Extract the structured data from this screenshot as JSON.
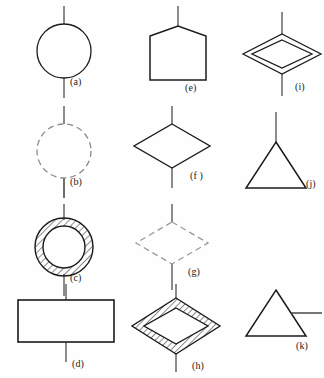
{
  "figure": {
    "background_color": "#fefefe",
    "stroke_color": "#1b1b1b",
    "dashed_stroke_color": "#8a8a8a",
    "lead_line_color": "#6e6e6e",
    "columns": 3,
    "rows": 4,
    "symbol_count": 11
  },
  "symbols": [
    {
      "id": "a",
      "label": "(a)",
      "shape": "circle",
      "fill": "none",
      "line_style": "solid",
      "hatched": false,
      "leads": "vertical-through",
      "column": 1,
      "row": 1
    },
    {
      "id": "b",
      "label": "(b)",
      "shape": "circle",
      "fill": "none",
      "line_style": "dashed",
      "hatched": false,
      "leads": "vertical-through",
      "column": 1,
      "row": 2
    },
    {
      "id": "c",
      "label": "(c)",
      "shape": "annulus",
      "fill": "none",
      "line_style": "solid",
      "hatched": true,
      "leads": "vertical-through",
      "column": 1,
      "row": 3
    },
    {
      "id": "d",
      "label": "(d)",
      "shape": "rectangle",
      "fill": "none",
      "line_style": "solid",
      "hatched": false,
      "leads": "vertical-through",
      "column": 1,
      "row": 4
    },
    {
      "id": "e",
      "label": "(e)",
      "shape": "pentagon-house",
      "fill": "none",
      "line_style": "solid",
      "hatched": false,
      "leads": "top-only",
      "column": 2,
      "row": 1
    },
    {
      "id": "f",
      "label": "(f )",
      "shape": "diamond",
      "fill": "none",
      "line_style": "solid",
      "hatched": false,
      "leads": "vertical-through",
      "column": 2,
      "row": 2
    },
    {
      "id": "g",
      "label": "(g)",
      "shape": "diamond",
      "fill": "none",
      "line_style": "dashed",
      "hatched": false,
      "leads": "vertical-through",
      "column": 2,
      "row": 3
    },
    {
      "id": "h",
      "label": "(h)",
      "shape": "double-diamond",
      "fill": "none",
      "line_style": "solid",
      "hatched": true,
      "leads": "vertical-through",
      "column": 2,
      "row": 4
    },
    {
      "id": "i",
      "label": "(i)",
      "shape": "double-diamond",
      "fill": "none",
      "line_style": "solid",
      "hatched": false,
      "leads": "vertical-through",
      "column": 3,
      "row": 1
    },
    {
      "id": "j",
      "label": "(j)",
      "shape": "triangle",
      "fill": "none",
      "line_style": "solid",
      "hatched": false,
      "leads": "top-apex",
      "column": 3,
      "row": 2
    },
    {
      "id": "k",
      "label": "(k)",
      "shape": "triangle",
      "fill": "none",
      "line_style": "solid",
      "hatched": false,
      "leads": "right-horizontal",
      "column": 3,
      "row": 4
    }
  ]
}
